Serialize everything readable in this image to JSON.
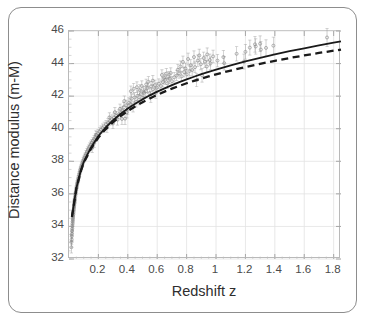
{
  "chart_data": {
    "type": "scatter",
    "title": "",
    "xlabel": "Redshift z",
    "ylabel": "Distance modulus (m-M)",
    "xlim": [
      0.0,
      1.85
    ],
    "ylim": [
      32,
      46
    ],
    "grid": true,
    "legend": "none",
    "xticks": [
      "0.2",
      "0.4",
      "0.6",
      "0.8",
      "1",
      "1.2",
      "1.4",
      "1.6",
      "1.8"
    ],
    "xtick_values": [
      0.2,
      0.4,
      0.6,
      0.8,
      1.0,
      1.2,
      1.4,
      1.6,
      1.8
    ],
    "yticks": [
      "32",
      "34",
      "36",
      "38",
      "40",
      "42",
      "44",
      "46"
    ],
    "ytick_values": [
      32,
      34,
      36,
      38,
      40,
      42,
      44,
      46
    ],
    "marker": "open-circle",
    "marker_color": "#8a8a8a",
    "errorbar_color": "#9a9a9a",
    "series": [
      {
        "name": "Type Ia supernovae",
        "type": "scatter-errorbar",
        "points": [
          [
            0.016,
            32.72,
            0.35
          ],
          [
            0.017,
            33.04,
            0.32
          ],
          [
            0.018,
            33.18,
            0.3
          ],
          [
            0.019,
            33.4,
            0.3
          ],
          [
            0.02,
            33.55,
            0.28
          ],
          [
            0.021,
            33.72,
            0.28
          ],
          [
            0.022,
            33.86,
            0.27
          ],
          [
            0.023,
            34.02,
            0.27
          ],
          [
            0.024,
            34.16,
            0.26
          ],
          [
            0.025,
            34.28,
            0.26
          ],
          [
            0.026,
            34.4,
            0.25
          ],
          [
            0.027,
            34.52,
            0.25
          ],
          [
            0.028,
            34.63,
            0.25
          ],
          [
            0.029,
            34.74,
            0.24
          ],
          [
            0.03,
            34.84,
            0.24
          ],
          [
            0.031,
            34.95,
            0.24
          ],
          [
            0.032,
            35.04,
            0.23
          ],
          [
            0.033,
            35.13,
            0.23
          ],
          [
            0.034,
            35.22,
            0.23
          ],
          [
            0.035,
            35.3,
            0.23
          ],
          [
            0.036,
            35.39,
            0.22
          ],
          [
            0.037,
            35.47,
            0.22
          ],
          [
            0.038,
            35.55,
            0.22
          ],
          [
            0.039,
            35.62,
            0.22
          ],
          [
            0.04,
            35.7,
            0.22
          ],
          [
            0.042,
            35.83,
            0.21
          ],
          [
            0.044,
            35.96,
            0.21
          ],
          [
            0.046,
            36.08,
            0.21
          ],
          [
            0.048,
            36.2,
            0.21
          ],
          [
            0.05,
            36.31,
            0.21
          ],
          [
            0.052,
            36.42,
            0.2
          ],
          [
            0.054,
            36.52,
            0.2
          ],
          [
            0.056,
            36.62,
            0.2
          ],
          [
            0.058,
            36.71,
            0.2
          ],
          [
            0.06,
            36.8,
            0.2
          ],
          [
            0.063,
            36.93,
            0.2
          ],
          [
            0.066,
            37.05,
            0.2
          ],
          [
            0.069,
            37.17,
            0.2
          ],
          [
            0.072,
            37.28,
            0.2
          ],
          [
            0.075,
            37.38,
            0.2
          ],
          [
            0.078,
            37.48,
            0.2
          ],
          [
            0.081,
            37.58,
            0.2
          ],
          [
            0.085,
            37.7,
            0.2
          ],
          [
            0.089,
            37.81,
            0.2
          ],
          [
            0.093,
            37.92,
            0.2
          ],
          [
            0.097,
            38.02,
            0.2
          ],
          [
            0.101,
            38.12,
            0.2
          ],
          [
            0.106,
            38.23,
            0.21
          ],
          [
            0.111,
            38.34,
            0.21
          ],
          [
            0.116,
            38.45,
            0.21
          ],
          [
            0.122,
            38.57,
            0.21
          ],
          [
            0.128,
            38.68,
            0.21
          ],
          [
            0.134,
            38.79,
            0.21
          ],
          [
            0.141,
            38.91,
            0.22
          ],
          [
            0.148,
            39.02,
            0.22
          ],
          [
            0.155,
            39.13,
            0.22
          ],
          [
            0.163,
            39.25,
            0.22
          ],
          [
            0.171,
            39.36,
            0.23
          ],
          [
            0.18,
            39.48,
            0.23
          ],
          [
            0.189,
            39.6,
            0.23
          ],
          [
            0.198,
            39.71,
            0.24
          ],
          [
            0.208,
            39.82,
            0.24
          ],
          [
            0.218,
            39.93,
            0.24
          ],
          [
            0.172,
            39.12,
            0.26
          ],
          [
            0.158,
            38.82,
            0.28
          ],
          [
            0.183,
            39.62,
            0.25
          ],
          [
            0.229,
            40.04,
            0.25
          ],
          [
            0.24,
            40.15,
            0.25
          ],
          [
            0.252,
            40.26,
            0.25
          ],
          [
            0.265,
            40.37,
            0.26
          ],
          [
            0.278,
            40.48,
            0.26
          ],
          [
            0.292,
            40.59,
            0.26
          ],
          [
            0.306,
            40.69,
            0.27
          ],
          [
            0.321,
            40.79,
            0.27
          ],
          [
            0.337,
            40.89,
            0.27
          ],
          [
            0.354,
            41.0,
            0.28
          ],
          [
            0.258,
            40.08,
            0.3
          ],
          [
            0.275,
            40.7,
            0.28
          ],
          [
            0.299,
            40.32,
            0.32
          ],
          [
            0.312,
            41.02,
            0.28
          ],
          [
            0.33,
            40.55,
            0.33
          ],
          [
            0.347,
            41.22,
            0.29
          ],
          [
            0.364,
            41.09,
            0.29
          ],
          [
            0.372,
            41.31,
            0.3
          ],
          [
            0.381,
            40.62,
            0.36
          ],
          [
            0.39,
            41.45,
            0.3
          ],
          [
            0.399,
            41.18,
            0.32
          ],
          [
            0.408,
            41.6,
            0.3
          ],
          [
            0.36,
            40.6,
            0.35
          ],
          [
            0.376,
            41.7,
            0.31
          ],
          [
            0.394,
            41.0,
            0.34
          ],
          [
            0.417,
            41.52,
            0.31
          ],
          [
            0.426,
            41.84,
            0.3
          ],
          [
            0.436,
            41.36,
            0.33
          ],
          [
            0.446,
            41.92,
            0.3
          ],
          [
            0.456,
            41.64,
            0.31
          ],
          [
            0.466,
            42.02,
            0.3
          ],
          [
            0.477,
            41.78,
            0.31
          ],
          [
            0.488,
            42.12,
            0.3
          ],
          [
            0.499,
            41.9,
            0.31
          ],
          [
            0.51,
            42.2,
            0.3
          ],
          [
            0.421,
            42.3,
            0.32
          ],
          [
            0.44,
            42.45,
            0.33
          ],
          [
            0.462,
            42.55,
            0.33
          ],
          [
            0.48,
            42.38,
            0.32
          ],
          [
            0.495,
            42.62,
            0.32
          ],
          [
            0.508,
            42.28,
            0.31
          ],
          [
            0.522,
            42.3,
            0.3
          ],
          [
            0.534,
            42.5,
            0.3
          ],
          [
            0.546,
            42.18,
            0.31
          ],
          [
            0.558,
            42.6,
            0.3
          ],
          [
            0.571,
            42.42,
            0.3
          ],
          [
            0.584,
            42.68,
            0.3
          ],
          [
            0.597,
            42.52,
            0.3
          ],
          [
            0.611,
            42.76,
            0.3
          ],
          [
            0.525,
            42.72,
            0.32
          ],
          [
            0.54,
            42.88,
            0.32
          ],
          [
            0.556,
            41.96,
            0.34
          ],
          [
            0.57,
            42.95,
            0.32
          ],
          [
            0.59,
            42.2,
            0.33
          ],
          [
            0.625,
            42.62,
            0.3
          ],
          [
            0.639,
            42.86,
            0.3
          ],
          [
            0.654,
            43.0,
            0.3
          ],
          [
            0.669,
            42.78,
            0.3
          ],
          [
            0.684,
            43.08,
            0.3
          ],
          [
            0.7,
            42.92,
            0.3
          ],
          [
            0.716,
            43.16,
            0.3
          ],
          [
            0.632,
            43.3,
            0.32
          ],
          [
            0.648,
            43.12,
            0.31
          ],
          [
            0.662,
            43.38,
            0.32
          ],
          [
            0.676,
            43.2,
            0.31
          ],
          [
            0.692,
            43.42,
            0.32
          ],
          [
            0.732,
            43.26,
            0.3
          ],
          [
            0.749,
            43.4,
            0.3
          ],
          [
            0.766,
            43.22,
            0.31
          ],
          [
            0.783,
            43.48,
            0.3
          ],
          [
            0.801,
            43.34,
            0.31
          ],
          [
            0.819,
            43.54,
            0.3
          ],
          [
            0.74,
            43.62,
            0.33
          ],
          [
            0.758,
            43.82,
            0.34
          ],
          [
            0.775,
            44.1,
            0.36
          ],
          [
            0.792,
            43.7,
            0.33
          ],
          [
            0.81,
            44.28,
            0.36
          ],
          [
            0.828,
            43.9,
            0.34
          ],
          [
            0.838,
            43.6,
            0.32
          ],
          [
            0.857,
            43.78,
            0.33
          ],
          [
            0.876,
            44.18,
            0.35
          ],
          [
            0.896,
            43.96,
            0.34
          ],
          [
            0.916,
            44.34,
            0.36
          ],
          [
            0.85,
            44.4,
            0.38
          ],
          [
            0.868,
            42.98,
            0.4
          ],
          [
            0.886,
            44.5,
            0.38
          ],
          [
            0.905,
            43.28,
            0.42
          ],
          [
            0.925,
            44.12,
            0.36
          ],
          [
            0.937,
            43.82,
            0.35
          ],
          [
            0.958,
            44.22,
            0.36
          ],
          [
            0.94,
            44.56,
            0.4
          ],
          [
            0.962,
            44.02,
            0.38
          ],
          [
            0.98,
            44.44,
            0.38
          ],
          [
            1.01,
            44.18,
            0.38
          ],
          [
            1.05,
            44.4,
            0.4
          ],
          [
            1.056,
            44.02,
            0.42
          ],
          [
            1.14,
            44.6,
            0.44
          ],
          [
            1.19,
            44.12,
            0.46
          ],
          [
            1.2,
            44.72,
            0.45
          ],
          [
            1.23,
            44.98,
            0.46
          ],
          [
            1.265,
            45.18,
            0.48
          ],
          [
            1.27,
            45.05,
            0.47
          ],
          [
            1.3,
            45.22,
            0.48
          ],
          [
            1.305,
            44.86,
            0.5
          ],
          [
            1.34,
            44.96,
            0.5
          ],
          [
            1.39,
            45.1,
            0.52
          ],
          [
            1.755,
            45.6,
            0.55
          ]
        ]
      }
    ],
    "curves": [
      {
        "name": "accelerating-universe-model",
        "style": "solid",
        "color": "#1a1a1a",
        "points": [
          [
            0.02,
            34.6
          ],
          [
            0.05,
            36.35
          ],
          [
            0.08,
            37.42
          ],
          [
            0.1,
            37.95
          ],
          [
            0.15,
            38.85
          ],
          [
            0.2,
            39.55
          ],
          [
            0.25,
            40.08
          ],
          [
            0.3,
            40.52
          ],
          [
            0.35,
            40.9
          ],
          [
            0.4,
            41.24
          ],
          [
            0.45,
            41.53
          ],
          [
            0.5,
            41.8
          ],
          [
            0.55,
            42.05
          ],
          [
            0.6,
            42.28
          ],
          [
            0.65,
            42.48
          ],
          [
            0.7,
            42.68
          ],
          [
            0.75,
            42.86
          ],
          [
            0.8,
            43.03
          ],
          [
            0.85,
            43.19
          ],
          [
            0.9,
            43.35
          ],
          [
            0.95,
            43.49
          ],
          [
            1.0,
            43.63
          ],
          [
            1.1,
            43.89
          ],
          [
            1.2,
            44.13
          ],
          [
            1.3,
            44.35
          ],
          [
            1.4,
            44.56
          ],
          [
            1.5,
            44.76
          ],
          [
            1.6,
            44.94
          ],
          [
            1.7,
            45.12
          ],
          [
            1.8,
            45.28
          ],
          [
            1.85,
            45.36
          ]
        ]
      },
      {
        "name": "decelerating-universe-model",
        "style": "dashed",
        "color": "#1a1a1a",
        "points": [
          [
            0.02,
            34.58
          ],
          [
            0.05,
            36.32
          ],
          [
            0.08,
            37.38
          ],
          [
            0.1,
            37.9
          ],
          [
            0.15,
            38.78
          ],
          [
            0.2,
            39.46
          ],
          [
            0.25,
            39.98
          ],
          [
            0.3,
            40.4
          ],
          [
            0.35,
            40.77
          ],
          [
            0.4,
            41.09
          ],
          [
            0.45,
            41.37
          ],
          [
            0.5,
            41.63
          ],
          [
            0.55,
            41.86
          ],
          [
            0.6,
            42.08
          ],
          [
            0.65,
            42.28
          ],
          [
            0.7,
            42.46
          ],
          [
            0.75,
            42.63
          ],
          [
            0.8,
            42.79
          ],
          [
            0.85,
            42.94
          ],
          [
            0.9,
            43.08
          ],
          [
            0.95,
            43.21
          ],
          [
            1.0,
            43.34
          ],
          [
            1.1,
            43.57
          ],
          [
            1.2,
            43.79
          ],
          [
            1.3,
            43.98
          ],
          [
            1.4,
            44.17
          ],
          [
            1.5,
            44.34
          ],
          [
            1.6,
            44.5
          ],
          [
            1.7,
            44.65
          ],
          [
            1.8,
            44.79
          ],
          [
            1.85,
            44.86
          ]
        ]
      }
    ]
  }
}
